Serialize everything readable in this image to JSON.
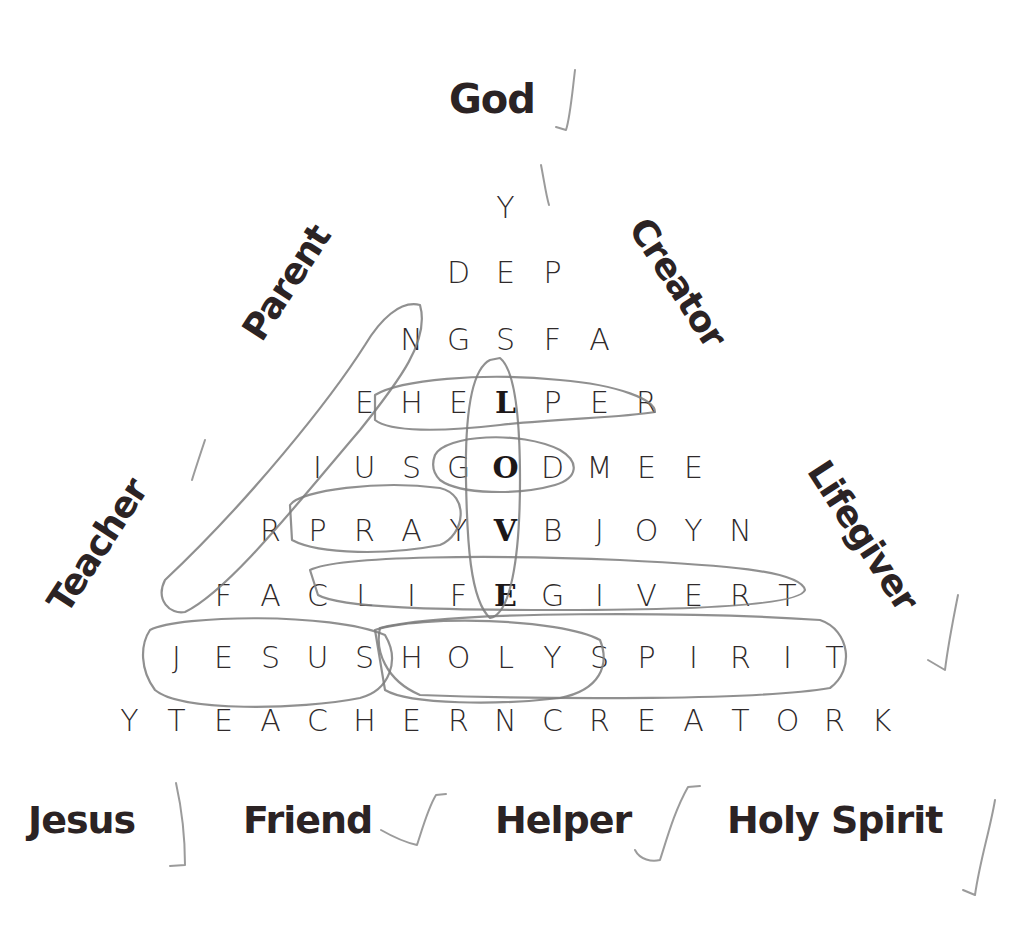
{
  "puzzle": {
    "top_word": "God",
    "side_words_left": [
      "Parent",
      "Teacher"
    ],
    "side_words_right": [
      "Creator",
      "Lifegiver"
    ],
    "bottom_words": [
      "Jesus",
      "Friend",
      "Helper",
      "Holy Spirit"
    ],
    "hidden_vertical_word": "LOVE",
    "grid": [
      [
        "Y"
      ],
      [
        "D",
        "E",
        "P"
      ],
      [
        "N",
        "G",
        "S",
        "F",
        "A"
      ],
      [
        "E",
        "H",
        "E",
        "L",
        "P",
        "E",
        "R"
      ],
      [
        "I",
        "U",
        "S",
        "G",
        "O",
        "D",
        "M",
        "E",
        "E"
      ],
      [
        "R",
        "P",
        "R",
        "A",
        "Y",
        "V",
        "B",
        "J",
        "O",
        "Y",
        "N"
      ],
      [
        "F",
        "A",
        "C",
        "L",
        "I",
        "F",
        "E",
        "G",
        "I",
        "V",
        "E",
        "R",
        "T"
      ],
      [
        "J",
        "E",
        "S",
        "U",
        "S",
        "H",
        "O",
        "L",
        "Y",
        "S",
        "P",
        "I",
        "R",
        "I",
        "T"
      ],
      [
        "Y",
        "T",
        "E",
        "A",
        "C",
        "H",
        "E",
        "R",
        "N",
        "C",
        "R",
        "E",
        "A",
        "T",
        "O",
        "R",
        "K"
      ]
    ],
    "bold_cells": [
      [
        3,
        3
      ],
      [
        4,
        4
      ],
      [
        5,
        5
      ],
      [
        6,
        6
      ]
    ],
    "checked_words": [
      "God",
      "Lifegiver",
      "Jesus",
      "Friend",
      "Helper",
      "Holy Spirit"
    ]
  }
}
